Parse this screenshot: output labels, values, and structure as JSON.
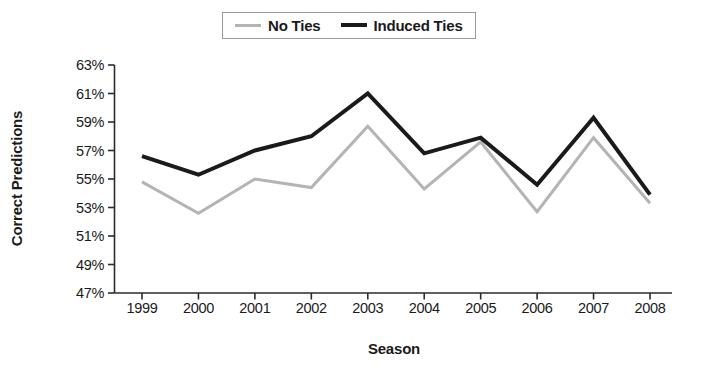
{
  "chart_data": {
    "type": "line",
    "title": "",
    "xlabel": "Season",
    "ylabel": "Correct Predictions",
    "categories": [
      "1999",
      "2000",
      "2001",
      "2002",
      "2003",
      "2004",
      "2005",
      "2006",
      "2007",
      "2008"
    ],
    "x": [
      1999,
      2000,
      2001,
      2002,
      2003,
      2004,
      2005,
      2006,
      2007,
      2008
    ],
    "series": [
      {
        "name": "No Ties",
        "color": "#b4b4b4",
        "values": [
          54.8,
          52.6,
          55.0,
          54.4,
          58.7,
          54.3,
          57.6,
          52.7,
          57.9,
          53.3
        ]
      },
      {
        "name": "Induced Ties",
        "color": "#1a1a1a",
        "values": [
          56.6,
          55.3,
          57.0,
          58.0,
          61.0,
          56.8,
          57.9,
          54.6,
          59.3,
          53.9
        ]
      }
    ],
    "ylim": [
      47,
      63
    ],
    "ytick_step": 2,
    "ytick_labels": [
      "63%",
      "61%",
      "59%",
      "57%",
      "55%",
      "53%",
      "51%",
      "49%",
      "47%"
    ],
    "ytick_values": [
      63,
      61,
      59,
      57,
      55,
      53,
      51,
      49,
      47
    ],
    "grid": false,
    "legend_position": "top-center",
    "legend_entries": [
      "No Ties",
      "Induced Ties"
    ]
  },
  "legend": {
    "items": [
      {
        "label": "No Ties",
        "swatch": "light-line-swatch"
      },
      {
        "label": "Induced Ties",
        "swatch": "dark-line-swatch"
      }
    ]
  },
  "axes": {
    "y_title": "Correct Predictions",
    "x_title": "Season"
  }
}
